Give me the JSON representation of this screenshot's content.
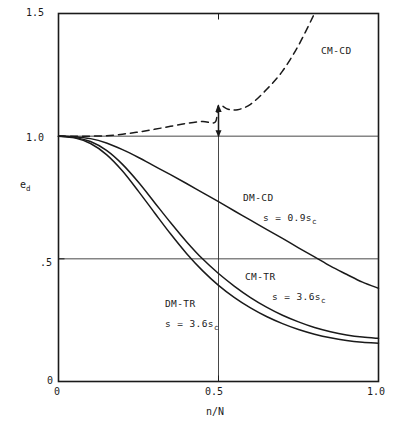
{
  "chart_data": {
    "type": "line",
    "title": "",
    "xlabel": "n/N",
    "ylabel": "e_d",
    "xlim": [
      0,
      1.0
    ],
    "ylim": [
      0,
      1.5
    ],
    "grid": "horizontal-reference-lines-at-0.5-and-1.0",
    "legend": "inline-curve-labels",
    "x_ticks": [
      "0",
      "0.5",
      "1.0"
    ],
    "x_tick_values": [
      0,
      0.5,
      1.0
    ],
    "y_ticks": [
      "0",
      ".5",
      "1.0",
      "1.5"
    ],
    "y_tick_values": [
      0,
      0.5,
      1.0,
      1.5
    ],
    "annotations": [
      {
        "text": "vertical jump with arrow at n/N = 0.5 from e_d = 1.0 to 1.125 on CM-CD curve",
        "x": 0.5,
        "y0": 1.0,
        "y1": 1.125
      }
    ],
    "series": [
      {
        "name": "CM-CD",
        "label": "CM-CD",
        "condition": "",
        "style": "dashed",
        "x": [
          0.0,
          0.05,
          0.1,
          0.15,
          0.2,
          0.25,
          0.3,
          0.35,
          0.4,
          0.45,
          0.49,
          0.5,
          0.53,
          0.56,
          0.6,
          0.65,
          0.7,
          0.75,
          0.8
        ],
        "y": [
          1.0,
          1.0,
          1.0,
          1.002,
          1.008,
          1.017,
          1.028,
          1.04,
          1.052,
          1.06,
          1.058,
          1.125,
          1.11,
          1.108,
          1.13,
          1.19,
          1.265,
          1.37,
          1.5
        ]
      },
      {
        "name": "DM-CD",
        "label": "DM-CD",
        "condition": "s = 0.9s_c",
        "condition_prefix": "s = 0.9s",
        "condition_sub": "c",
        "style": "solid",
        "x": [
          0.0,
          0.05,
          0.1,
          0.15,
          0.2,
          0.25,
          0.3,
          0.35,
          0.4,
          0.45,
          0.5,
          0.55,
          0.6,
          0.65,
          0.7,
          0.75,
          0.8,
          0.85,
          0.9,
          0.95,
          1.0
        ],
        "y": [
          1.0,
          0.998,
          0.99,
          0.972,
          0.945,
          0.913,
          0.878,
          0.843,
          0.807,
          0.77,
          0.733,
          0.695,
          0.658,
          0.62,
          0.583,
          0.545,
          0.508,
          0.47,
          0.437,
          0.405,
          0.38
        ]
      },
      {
        "name": "CM-TR",
        "label": "CM-TR",
        "condition": "s = 3.6s_c",
        "condition_prefix": "s = 3.6s",
        "condition_sub": "c",
        "style": "solid",
        "x": [
          0.0,
          0.05,
          0.1,
          0.15,
          0.2,
          0.25,
          0.3,
          0.35,
          0.4,
          0.45,
          0.5,
          0.55,
          0.6,
          0.65,
          0.7,
          0.75,
          0.8,
          0.85,
          0.9,
          0.95,
          1.0
        ],
        "y": [
          1.0,
          0.995,
          0.978,
          0.942,
          0.885,
          0.812,
          0.73,
          0.648,
          0.57,
          0.5,
          0.44,
          0.388,
          0.342,
          0.303,
          0.27,
          0.243,
          0.22,
          0.203,
          0.19,
          0.181,
          0.176
        ]
      },
      {
        "name": "DM-TR",
        "label": "DM-TR",
        "condition": "s = 3.6s_c",
        "condition_prefix": "s = 3.6s",
        "condition_sub": "c",
        "style": "solid",
        "x": [
          0.0,
          0.05,
          0.1,
          0.15,
          0.2,
          0.25,
          0.3,
          0.35,
          0.4,
          0.45,
          0.5,
          0.55,
          0.6,
          0.65,
          0.7,
          0.75,
          0.8,
          0.85,
          0.9,
          0.95,
          1.0
        ],
        "y": [
          1.0,
          0.993,
          0.97,
          0.925,
          0.858,
          0.775,
          0.688,
          0.602,
          0.522,
          0.452,
          0.392,
          0.342,
          0.3,
          0.265,
          0.236,
          0.212,
          0.193,
          0.178,
          0.167,
          0.16,
          0.156
        ]
      }
    ]
  },
  "axes": {
    "y_label_main": "e",
    "y_label_sub": "d",
    "x_label": "n/N",
    "y_tick_top": "1.5",
    "y_tick_one": "1.0",
    "y_tick_half": ".5",
    "y_tick_zero": "0",
    "x_tick_zero": "0",
    "x_tick_mid": "0.5",
    "x_tick_max": "1.0"
  },
  "labels": {
    "cm_cd": "CM-CD",
    "dm_cd": "DM-CD",
    "dm_cd_cond_prefix": "s = 0.9s",
    "dm_cd_cond_sub": "c",
    "cm_tr": "CM-TR",
    "cm_tr_cond_prefix": "s = 3.6s",
    "cm_tr_cond_sub": "c",
    "dm_tr": "DM-TR",
    "dm_tr_cond_prefix": "s = 3.6s",
    "dm_tr_cond_sub": "c"
  },
  "colors": {
    "ink": "#1a1a1a",
    "frame": "#000000",
    "reference_line": "#333333",
    "background": "#ffffff"
  }
}
